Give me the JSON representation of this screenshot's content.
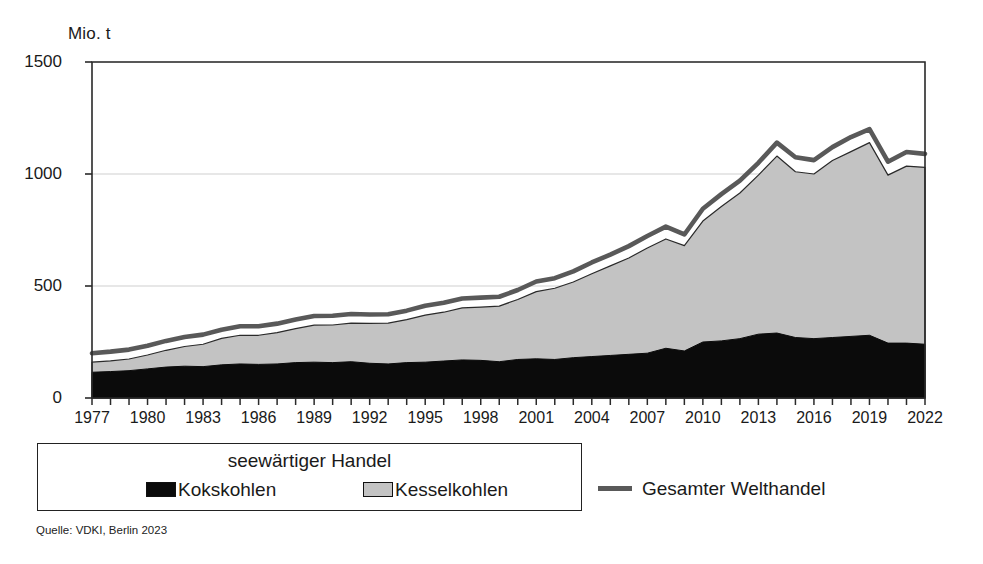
{
  "chart_data": {
    "type": "area",
    "title": "",
    "ylabel": "Mio. t",
    "xlabel": "",
    "ylim": [
      0,
      1500
    ],
    "yticks": [
      0,
      500,
      1000,
      1500
    ],
    "xlim": [
      1977,
      2022
    ],
    "xticks": [
      1977,
      1980,
      1983,
      1986,
      1989,
      1992,
      1995,
      1998,
      2001,
      2004,
      2007,
      2010,
      2013,
      2016,
      2019,
      2022
    ],
    "grid": true,
    "legend_position": "below-left",
    "stacked": true,
    "x": [
      1977,
      1978,
      1979,
      1980,
      1981,
      1982,
      1983,
      1984,
      1985,
      1986,
      1987,
      1988,
      1989,
      1990,
      1991,
      1992,
      1993,
      1994,
      1995,
      1996,
      1997,
      1998,
      1999,
      2000,
      2001,
      2002,
      2003,
      2004,
      2005,
      2006,
      2007,
      2008,
      2009,
      2010,
      2011,
      2012,
      2013,
      2014,
      2015,
      2016,
      2017,
      2018,
      2019,
      2020,
      2021,
      2022
    ],
    "series": [
      {
        "name": "Kokskohlen",
        "fill": "#0b0b0b",
        "values": [
          115,
          118,
          122,
          130,
          138,
          142,
          140,
          148,
          152,
          150,
          152,
          158,
          160,
          158,
          162,
          155,
          152,
          158,
          160,
          165,
          170,
          168,
          162,
          172,
          175,
          172,
          180,
          185,
          190,
          195,
          200,
          222,
          210,
          250,
          255,
          265,
          285,
          290,
          270,
          265,
          270,
          275,
          280,
          245,
          245,
          240
        ]
      },
      {
        "name": "Kesselkohlen",
        "fill": "#c3c3c3",
        "values": [
          45,
          48,
          52,
          62,
          75,
          88,
          100,
          118,
          128,
          130,
          140,
          152,
          165,
          168,
          172,
          178,
          182,
          192,
          210,
          218,
          232,
          238,
          248,
          268,
          300,
          318,
          338,
          370,
          400,
          430,
          470,
          488,
          470,
          540,
          600,
          650,
          710,
          790,
          740,
          735,
          790,
          825,
          860,
          750,
          790,
          790
        ]
      }
    ],
    "seaborne_total": [
      160,
      166,
      174,
      192,
      213,
      230,
      240,
      266,
      280,
      280,
      292,
      310,
      325,
      326,
      334,
      333,
      334,
      350,
      370,
      383,
      402,
      406,
      410,
      440,
      475,
      490,
      518,
      555,
      590,
      625,
      670,
      710,
      680,
      790,
      855,
      915,
      995,
      1080,
      1010,
      1000,
      1060,
      1100,
      1140,
      995,
      1035,
      1030
    ],
    "line_series": {
      "name": "Gesamter Welthandel",
      "color": "#595959",
      "values": [
        200,
        207,
        216,
        233,
        255,
        272,
        283,
        305,
        320,
        320,
        332,
        350,
        366,
        367,
        375,
        373,
        374,
        390,
        412,
        425,
        444,
        448,
        452,
        482,
        520,
        535,
        565,
        605,
        640,
        678,
        723,
        765,
        730,
        845,
        910,
        970,
        1050,
        1140,
        1075,
        1062,
        1120,
        1165,
        1200,
        1055,
        1098,
        1090
      ]
    }
  },
  "legend": {
    "title": "seewärtiger Handel",
    "entries": [
      {
        "label": "Kokskohlen",
        "swatch": "black"
      },
      {
        "label": "Kesselkohlen",
        "swatch": "gray"
      }
    ],
    "line_entry": {
      "label": "Gesamter Welthandel"
    }
  },
  "source": "Quelle: VDKI, Berlin 2023",
  "colors": {
    "koks": "#0b0b0b",
    "kessel": "#c3c3c3",
    "line": "#595959",
    "axis": "#2a2a2a",
    "grid": "#cfcfcf"
  }
}
